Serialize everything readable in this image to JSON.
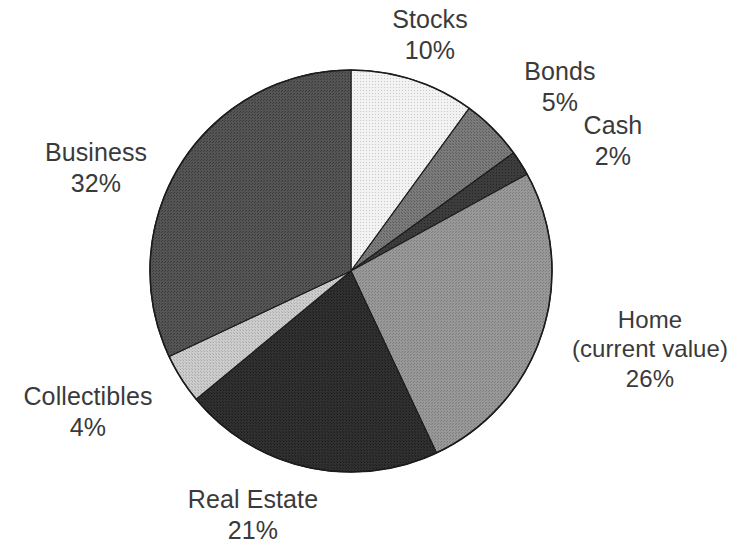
{
  "figure": {
    "name": "net-worth-allocation-pie-chart",
    "background_color": "#ffffff"
  },
  "chart_data": {
    "type": "pie",
    "title": "",
    "subtitle": "",
    "xlabel": "",
    "ylabel": "",
    "legend_position": "none",
    "grid": false,
    "units": "percent",
    "total": 100,
    "start_angle_deg": 0,
    "direction": "clockwise",
    "categories": [
      "Stocks",
      "Bonds",
      "Cash",
      "Home (current value)",
      "Real Estate",
      "Collectibles",
      "Business"
    ],
    "values": [
      10,
      5,
      2,
      26,
      21,
      4,
      32
    ],
    "slices": [
      {
        "label": "Stocks",
        "label_line1": "Stocks",
        "value": 10,
        "value_label": "10%",
        "color": "#e6e6e6",
        "start_deg": 0,
        "end_deg": 36
      },
      {
        "label": "Bonds",
        "label_line1": "Bonds",
        "value": 5,
        "value_label": "5%",
        "color": "#6f6f6f",
        "start_deg": 36,
        "end_deg": 54
      },
      {
        "label": "Cash",
        "label_line1": "Cash",
        "value": 2,
        "value_label": "2%",
        "color": "#343434",
        "start_deg": 54,
        "end_deg": 61.2
      },
      {
        "label": "Home (current value)",
        "label_line1": "Home",
        "label_line2": "(current value)",
        "value": 26,
        "value_label": "26%",
        "color": "#8d8d8d",
        "start_deg": 61.2,
        "end_deg": 154.8
      },
      {
        "label": "Real Estate",
        "label_line1": "Real Estate",
        "value": 21,
        "value_label": "21%",
        "color": "#2b2b2b",
        "start_deg": 154.8,
        "end_deg": 230.4
      },
      {
        "label": "Collectibles",
        "label_line1": "Collectibles",
        "value": 4,
        "value_label": "4%",
        "color": "#c2c2c2",
        "start_deg": 230.4,
        "end_deg": 244.8
      },
      {
        "label": "Business",
        "label_line1": "Business",
        "value": 32,
        "value_label": "32%",
        "color": "#4b4b4b",
        "start_deg": 244.8,
        "end_deg": 360
      }
    ],
    "geometry": {
      "center_x": 351,
      "center_y": 271,
      "radius": 201
    },
    "outline_color": "#1c1c1c"
  }
}
